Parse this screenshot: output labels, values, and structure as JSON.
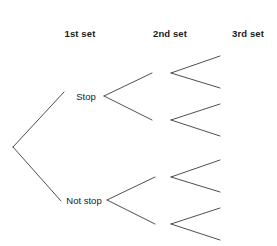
{
  "diagram": {
    "type": "probability-tree",
    "title": "",
    "background_color": "#ffffff",
    "line_color": "#3a3a3a",
    "text_color": "#1b1b1b",
    "columns": [
      {
        "id": "col1",
        "label": "1st set",
        "center_x": 80
      },
      {
        "id": "col2",
        "label": "2nd set",
        "center_x": 170
      },
      {
        "id": "col3",
        "label": "3rd set",
        "center_x": 248
      }
    ],
    "nodes": [
      {
        "id": "root",
        "label": "",
        "x": 13,
        "y": 147
      },
      {
        "id": "stop",
        "label": "Stop",
        "x": 86,
        "y": 96
      },
      {
        "id": "not-stop",
        "label": "Not stop",
        "x": 84,
        "y": 200
      },
      {
        "id": "n2-a",
        "label": "",
        "x": 171,
        "y": 73
      },
      {
        "id": "n2-b",
        "label": "",
        "x": 171,
        "y": 120
      },
      {
        "id": "n2-c",
        "label": "",
        "x": 171,
        "y": 177
      },
      {
        "id": "n2-d",
        "label": "",
        "x": 171,
        "y": 224
      },
      {
        "id": "leaf-1",
        "label": "",
        "x": 220,
        "y": 56
      },
      {
        "id": "leaf-2",
        "label": "",
        "x": 220,
        "y": 88
      },
      {
        "id": "leaf-3",
        "label": "",
        "x": 220,
        "y": 104
      },
      {
        "id": "leaf-4",
        "label": "",
        "x": 220,
        "y": 136
      },
      {
        "id": "leaf-5",
        "label": "",
        "x": 220,
        "y": 160
      },
      {
        "id": "leaf-6",
        "label": "",
        "x": 220,
        "y": 192
      },
      {
        "id": "leaf-7",
        "label": "",
        "x": 220,
        "y": 208
      },
      {
        "id": "leaf-8",
        "label": "",
        "x": 220,
        "y": 240
      }
    ],
    "edges": [
      {
        "id": "e-root-stop",
        "from": "root",
        "to": "stop",
        "x1": 13,
        "y1": 147,
        "x2": 64,
        "y2": 92
      },
      {
        "id": "e-root-notstop",
        "from": "root",
        "to": "not-stop",
        "x1": 13,
        "y1": 147,
        "x2": 61,
        "y2": 201
      },
      {
        "id": "e-stop-up",
        "from": "stop",
        "to": "n2-a",
        "x1": 104,
        "y1": 96,
        "x2": 152,
        "y2": 73
      },
      {
        "id": "e-stop-down",
        "from": "stop",
        "to": "n2-b",
        "x1": 104,
        "y1": 96,
        "x2": 152,
        "y2": 120
      },
      {
        "id": "e-notstop-up",
        "from": "not-stop",
        "to": "n2-c",
        "x1": 107,
        "y1": 200,
        "x2": 155,
        "y2": 177
      },
      {
        "id": "e-notstop-down",
        "from": "not-stop",
        "to": "n2-d",
        "x1": 107,
        "y1": 200,
        "x2": 155,
        "y2": 224
      },
      {
        "id": "e-a-up",
        "from": "n2-a",
        "to": "leaf-1",
        "x1": 171,
        "y1": 73,
        "x2": 220,
        "y2": 56
      },
      {
        "id": "e-a-down",
        "from": "n2-a",
        "to": "leaf-2",
        "x1": 171,
        "y1": 73,
        "x2": 220,
        "y2": 88
      },
      {
        "id": "e-b-up",
        "from": "n2-b",
        "to": "leaf-3",
        "x1": 171,
        "y1": 120,
        "x2": 220,
        "y2": 104
      },
      {
        "id": "e-b-down",
        "from": "n2-b",
        "to": "leaf-4",
        "x1": 171,
        "y1": 120,
        "x2": 220,
        "y2": 136
      },
      {
        "id": "e-c-up",
        "from": "n2-c",
        "to": "leaf-5",
        "x1": 171,
        "y1": 177,
        "x2": 220,
        "y2": 160
      },
      {
        "id": "e-c-down",
        "from": "n2-c",
        "to": "leaf-6",
        "x1": 171,
        "y1": 177,
        "x2": 220,
        "y2": 192
      },
      {
        "id": "e-d-up",
        "from": "n2-d",
        "to": "leaf-7",
        "x1": 171,
        "y1": 224,
        "x2": 220,
        "y2": 208
      },
      {
        "id": "e-d-down",
        "from": "n2-d",
        "to": "leaf-8",
        "x1": 171,
        "y1": 224,
        "x2": 220,
        "y2": 240
      }
    ],
    "header_baseline_y": 28
  }
}
